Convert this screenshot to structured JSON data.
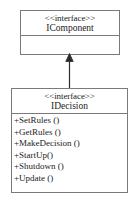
{
  "diagram": {
    "type": "uml-class-diagram",
    "background_color": "#ffffff",
    "line_color": "#7a7a7a",
    "text_color": "#1c1c1c"
  },
  "classes": [
    {
      "id": "icomponent",
      "stereotype": "<<interface>>",
      "name": "IComponent",
      "members": []
    },
    {
      "id": "idecision",
      "stereotype": "<<interface>>",
      "name": "IDecision",
      "members": [
        "+SetRules ()",
        "+GetRules ()",
        "+MakeDecision ()",
        "+StartUp()",
        "+Shutdown ()",
        "+Update ()"
      ]
    }
  ],
  "relationships": [
    {
      "id": "generalization-1",
      "kind": "generalization",
      "from": "IDecision",
      "to": "IComponent",
      "arrow": "closed-triangle-up"
    }
  ]
}
